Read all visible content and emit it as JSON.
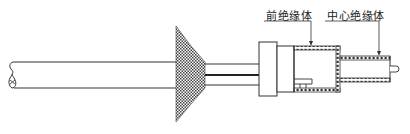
{
  "diagram": {
    "type": "cable connector cross-section",
    "labels": [
      {
        "id": "front-insulator",
        "text": "前绝缘体"
      },
      {
        "id": "center-insulator",
        "text": "中心绝缘体"
      }
    ],
    "colors": {
      "line": "#333333",
      "hatch": "#555555",
      "background": "#ffffff"
    }
  }
}
